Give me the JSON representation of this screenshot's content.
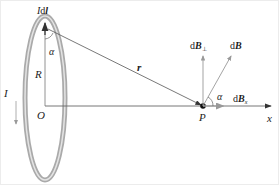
{
  "diagram": {
    "labels": {
      "current_element": "Idl",
      "current_element_prefix": "I",
      "current_element_d": "d",
      "current_element_l": "l",
      "current": "I",
      "radius": "R",
      "angle_top": "α",
      "center": "O",
      "position_vector": "r",
      "field_point": "P",
      "axis": "x",
      "angle_at_P": "α",
      "dB": "B",
      "dB_perp": "B",
      "dB_perp_sub": "⊥",
      "dB_x": "B",
      "dB_x_sub": "x",
      "d": "d"
    },
    "colors": {
      "loop": "#aaaaaa",
      "loop_inner": "#dddddd",
      "lines": "#555555",
      "vectors": "#888888",
      "text": "#222222"
    }
  }
}
